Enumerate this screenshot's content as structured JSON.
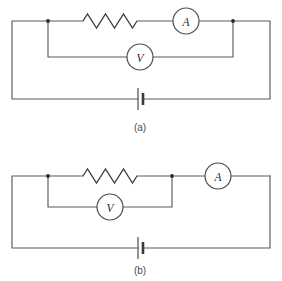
{
  "figure": {
    "background_color": "#ffffff",
    "wire_color": "#5a5a5a",
    "component_color": "#3c3c3c",
    "node_color": "#2a2a2a",
    "label_color": "#2b2b2b",
    "caption_color": "#4a4a4a"
  },
  "circuits": [
    {
      "id": "circuit-a",
      "caption": "(a)",
      "caption_x": 140,
      "caption_y": 127,
      "outer_loop": {
        "left_x": 12,
        "right_x": 270,
        "top_y": 21,
        "bottom_y": 99
      },
      "branch_y": 57,
      "nodes": [
        {
          "name": "left-node",
          "x": 48,
          "y": 21
        },
        {
          "name": "right-node",
          "x": 233,
          "y": 21
        }
      ],
      "resistor": {
        "name": "resistor",
        "x_start": 83,
        "x_end": 137,
        "y": 21,
        "peaks": 6,
        "amplitude": 7
      },
      "ammeter": {
        "name": "ammeter",
        "label": "A",
        "cx": 186,
        "cy": 21,
        "r": 13,
        "lead_left_x": 137,
        "lead_right_x": 233
      },
      "voltmeter": {
        "name": "voltmeter",
        "label": "V",
        "cx": 140,
        "cy": 57,
        "r": 13,
        "lead_left_x": 48,
        "lead_right_x": 233
      },
      "battery": {
        "name": "battery",
        "x_long_plate": 138,
        "x_short_plate": 143,
        "y": 99,
        "long_plate_half_height": 11,
        "short_plate_half_height": 6
      }
    },
    {
      "id": "circuit-b",
      "caption": "(b)",
      "caption_x": 140,
      "caption_y": 270,
      "outer_loop": {
        "left_x": 12,
        "right_x": 270,
        "top_y": 176,
        "bottom_y": 248
      },
      "branch_y": 207,
      "nodes": [
        {
          "name": "left-node",
          "x": 48,
          "y": 176
        },
        {
          "name": "right-node",
          "x": 172,
          "y": 176
        }
      ],
      "resistor": {
        "name": "resistor",
        "x_start": 83,
        "x_end": 137,
        "y": 176,
        "peaks": 6,
        "amplitude": 7
      },
      "ammeter": {
        "name": "ammeter",
        "label": "A",
        "cx": 218,
        "cy": 176,
        "r": 13,
        "lead_left_x": 172,
        "lead_right_x": 270
      },
      "voltmeter": {
        "name": "voltmeter",
        "label": "V",
        "cx": 110,
        "cy": 207,
        "r": 13,
        "lead_left_x": 48,
        "lead_right_x": 172
      },
      "battery": {
        "name": "battery",
        "x_long_plate": 138,
        "x_short_plate": 143,
        "y": 248,
        "long_plate_half_height": 11,
        "short_plate_half_height": 6
      }
    }
  ]
}
